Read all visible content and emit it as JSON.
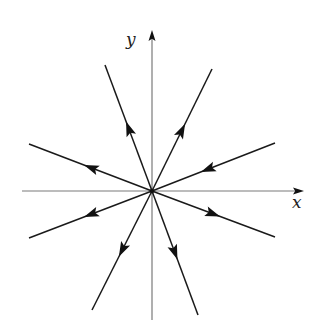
{
  "figure": {
    "type": "phase-portrait",
    "origin": [
      152,
      191
    ],
    "axes": {
      "x": {
        "label": "x",
        "start": [
          22,
          191
        ],
        "end": [
          304,
          191
        ],
        "label_pos": [
          292,
          208
        ]
      },
      "y": {
        "label": "y",
        "start": [
          152,
          320
        ],
        "end": [
          152,
          30
        ],
        "label_pos": [
          126,
          45
        ]
      }
    },
    "rays": [
      {
        "name": "upper-left-steep",
        "end": [
          105,
          65
        ],
        "arrow_at": 0.5,
        "direction": "outward"
      },
      {
        "name": "upper-right-steep",
        "end": [
          212,
          69
        ],
        "arrow_at": 0.5,
        "direction": "outward"
      },
      {
        "name": "upper-left-shallow",
        "end": [
          29,
          144
        ],
        "arrow_at": 0.5,
        "direction": "outward"
      },
      {
        "name": "upper-right-shallow",
        "end": [
          275,
          143
        ],
        "arrow_at": 0.45,
        "direction": "inward"
      },
      {
        "name": "lower-left-shallow",
        "end": [
          29,
          238
        ],
        "arrow_at": 0.5,
        "direction": "outward"
      },
      {
        "name": "lower-right-shallow",
        "end": [
          275,
          237
        ],
        "arrow_at": 0.5,
        "direction": "outward"
      },
      {
        "name": "lower-left-steep",
        "end": [
          92,
          310
        ],
        "arrow_at": 0.5,
        "direction": "outward"
      },
      {
        "name": "lower-right-steep",
        "end": [
          198,
          315
        ],
        "arrow_at": 0.5,
        "direction": "outward"
      }
    ],
    "colors": {
      "axis": "#7a7a7a",
      "ray": "#1a1a1a",
      "arrow": "#111111",
      "background": "#ffffff"
    }
  }
}
